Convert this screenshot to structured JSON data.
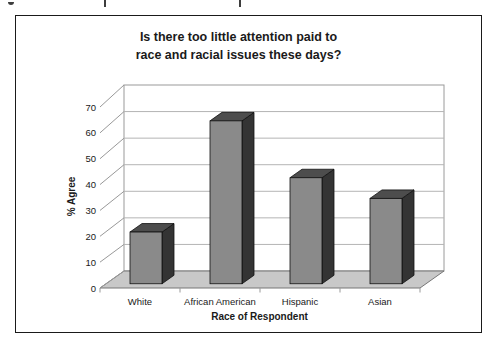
{
  "figure": {
    "title_line1": "Is there too little attention paid to",
    "title_line2": "race and racial issues these days?"
  },
  "chart_data": {
    "type": "bar",
    "projection": "3d",
    "title": "Is there too little attention paid to race and racial issues these days?",
    "xlabel": "Race of Respondent",
    "ylabel": "% Agree",
    "categories": [
      "White",
      "African American",
      "Hispanic",
      "Asian"
    ],
    "values": [
      20,
      63,
      41,
      33
    ],
    "ylim": [
      0,
      70
    ],
    "yticks": [
      0,
      10,
      20,
      30,
      40,
      50,
      60,
      70
    ],
    "grid": true,
    "legend": false,
    "colors": {
      "bar_front": "#8a8a8a",
      "bar_top": "#4d4d4d",
      "bar_side": "#343434",
      "floor": "#c8c8c8",
      "floor_edge": "#777777",
      "wall": "#ffffff",
      "wall_border": "#9a9a9a",
      "gridline": "#b4b4b4",
      "tick": "#999999",
      "text": "#1a1a1a",
      "frame": "#1a1a1a"
    }
  }
}
